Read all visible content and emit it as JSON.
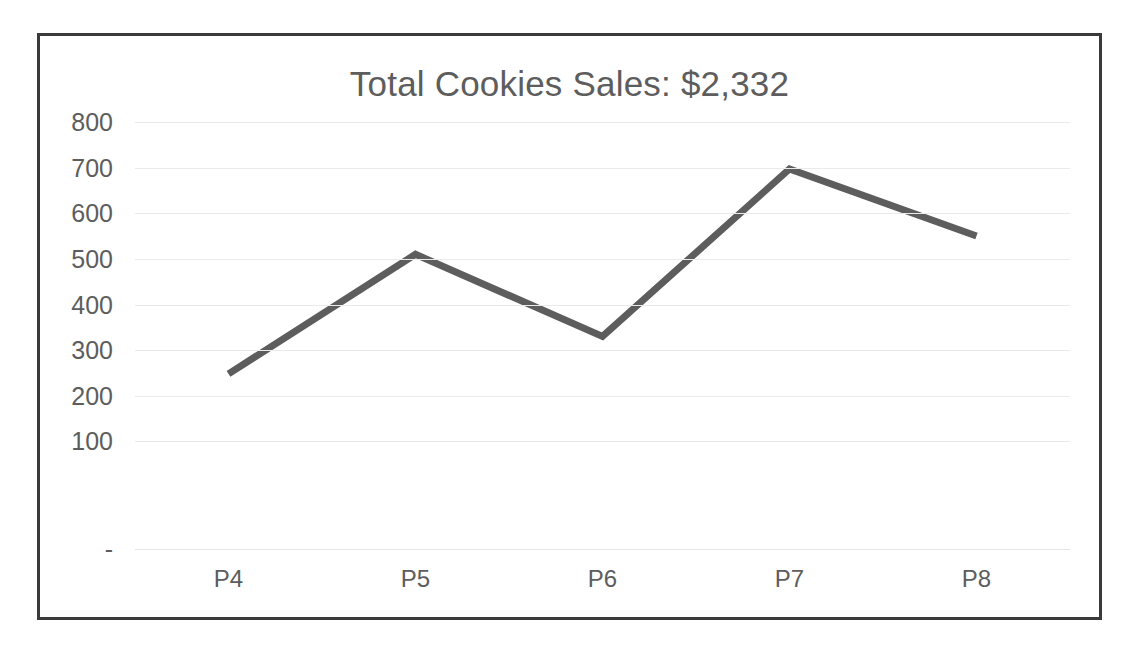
{
  "chart": {
    "title": "Total Cookies Sales: $2,332",
    "border_color": "#3a3a3a",
    "line_color": "#5d5d5d",
    "grid_color": "#e9eaec",
    "text_color": "#5d5d5d"
  },
  "chart_data": {
    "type": "line",
    "title": "Total Cookies Sales: $2,332",
    "xlabel": "",
    "ylabel": "",
    "categories": [
      "P4",
      "P5",
      "P6",
      "P7",
      "P8"
    ],
    "values": [
      248,
      510,
      330,
      697,
      550
    ],
    "series": [
      {
        "name": "Cookies Sales",
        "values": [
          248,
          510,
          330,
          697,
          550
        ]
      }
    ],
    "ylim": [
      0,
      800
    ],
    "ytick_values": [
      800,
      700,
      600,
      500,
      400,
      300,
      200,
      100,
      0
    ],
    "ytick_labels": [
      "800",
      "700",
      "600",
      "500",
      "400",
      "300",
      "200",
      "100",
      "-"
    ],
    "grid": true,
    "grid_axis": "y",
    "legend": false,
    "legend_position": "none",
    "markers": false,
    "line_width": 7,
    "annotations": []
  }
}
